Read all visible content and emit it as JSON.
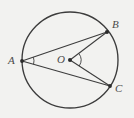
{
  "figure": {
    "kind": "circle-geometry-diagram",
    "background_color": "#f2f2f0",
    "stroke_color": "#3c3c3c",
    "label_color": "#4a4a4a",
    "width": 134,
    "height": 118
  },
  "circle": {
    "center_label": "O",
    "center_x": 70,
    "center_y": 60,
    "radius": 48
  },
  "points": [
    {
      "label": "A",
      "x": 22,
      "y": 61,
      "label_x": 8,
      "label_y": 55,
      "dot": true
    },
    {
      "label": "B",
      "x": 107,
      "y": 32,
      "label_x": 112,
      "label_y": 19,
      "dot": true
    },
    {
      "label": "C",
      "x": 110,
      "y": 86,
      "label_x": 115,
      "label_y": 83,
      "dot": true
    },
    {
      "label": "O",
      "x": 70,
      "y": 60,
      "label_x": 57,
      "label_y": 54,
      "dot": true
    }
  ],
  "segments": [
    {
      "name": "chord-AB",
      "from": "A",
      "to": "B"
    },
    {
      "name": "chord-AC",
      "from": "A",
      "to": "C"
    },
    {
      "name": "radius-OB",
      "from": "O",
      "to": "B"
    },
    {
      "name": "radius-OC",
      "from": "O",
      "to": "C"
    }
  ],
  "angle_marks": [
    {
      "name": "inscribed-angle-BAC",
      "vertex": "A",
      "radius": 12
    },
    {
      "name": "central-angle-BOC",
      "vertex": "O",
      "radius": 11
    }
  ],
  "labels": {
    "a": "A",
    "b": "B",
    "c": "C",
    "o": "O"
  }
}
